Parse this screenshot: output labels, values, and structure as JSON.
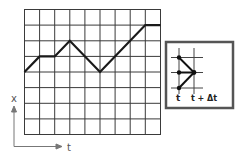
{
  "diagram": {
    "axis_labels": {
      "y": "x",
      "x": "t"
    },
    "grid": {
      "columns": 9,
      "rows": 8
    },
    "path_points_grid": [
      [
        0,
        4
      ],
      [
        1,
        3
      ],
      [
        2,
        3
      ],
      [
        3,
        2
      ],
      [
        5,
        4
      ],
      [
        8,
        1
      ],
      [
        9,
        1
      ]
    ],
    "inset": {
      "labels": {
        "left": "t",
        "right": "t + Δt"
      },
      "description": "three points at time t converging to one point at time t + Δt"
    },
    "colors": {
      "line": "#222222",
      "grid": "#333333",
      "axis": "#666666"
    }
  }
}
